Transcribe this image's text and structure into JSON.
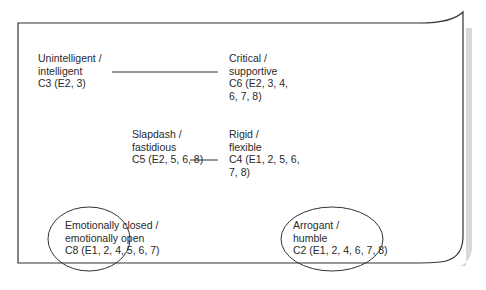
{
  "diagram": {
    "nodes": [
      {
        "id": "C3",
        "lines": [
          "Unintelligent /",
          "intelligent",
          "C3 (E2, 3)"
        ],
        "shape": "none"
      },
      {
        "id": "C6",
        "lines": [
          "Critical /",
          "supportive",
          "C6 (E2, 3, 4,",
          "6, 7, 8)"
        ],
        "shape": "none"
      },
      {
        "id": "C5",
        "lines": [
          "Slapdash /",
          "fastidious",
          "C5 (E2, 5, 6, 8)"
        ],
        "shape": "none"
      },
      {
        "id": "C4",
        "lines": [
          "Rigid /",
          "flexible",
          "C4 (E1, 2, 5, 6,",
          "7, 8)"
        ],
        "shape": "none"
      },
      {
        "id": "C8",
        "lines": [
          "Emotionally closed /",
          "emotionally open",
          "C8 (E1, 2, 4, 5, 6, 7)"
        ],
        "shape": "ellipse"
      },
      {
        "id": "C2",
        "lines": [
          "Arrogant /",
          "humble",
          "C2 (E1, 2, 4, 6, 7, 8)"
        ],
        "shape": "ellipse"
      }
    ],
    "edges": [
      {
        "from": "C3",
        "to": "C6"
      },
      {
        "from": "C5",
        "to": "C4"
      }
    ],
    "colors": {
      "line": "#333333",
      "text": "#2a2a2a",
      "shadow": "#d9d9d9"
    }
  }
}
